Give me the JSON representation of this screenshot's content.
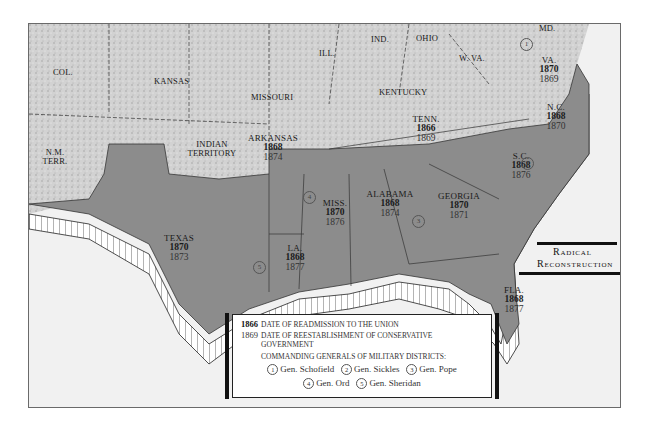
{
  "map": {
    "title_line1": "Radical",
    "title_line2": "Reconstruction",
    "colors": {
      "confederate_fill": "#8c8c8c",
      "union_fill": "#d4d4d4",
      "sea": "#f1f1f1",
      "border": "#333333"
    },
    "non_confederate_regions": [
      {
        "name": "COL."
      },
      {
        "name": "KANSAS"
      },
      {
        "name": "MISSOURI"
      },
      {
        "name": "ILL."
      },
      {
        "name": "IND."
      },
      {
        "name": "OHIO"
      },
      {
        "name": "W. VA."
      },
      {
        "name": "MD."
      },
      {
        "name": "KENTUCKY"
      },
      {
        "name": "INDIAN TERRITORY"
      },
      {
        "name": "N.M. TERR."
      }
    ],
    "states": [
      {
        "name": "VA.",
        "readmission": "1870",
        "conservative": "1869"
      },
      {
        "name": "N.C.",
        "readmission": "1868",
        "conservative": "1870"
      },
      {
        "name": "TENN.",
        "readmission": "1866",
        "conservative": "1869"
      },
      {
        "name": "S.C.",
        "readmission": "1868",
        "conservative": "1876"
      },
      {
        "name": "ARKANSAS",
        "readmission": "1868",
        "conservative": "1874"
      },
      {
        "name": "MISS.",
        "readmission": "1870",
        "conservative": "1876"
      },
      {
        "name": "ALABAMA",
        "readmission": "1868",
        "conservative": "1874"
      },
      {
        "name": "GEORGIA",
        "readmission": "1870",
        "conservative": "1871"
      },
      {
        "name": "TEXAS",
        "readmission": "1870",
        "conservative": "1873"
      },
      {
        "name": "LA.",
        "readmission": "1868",
        "conservative": "1877"
      },
      {
        "name": "FLA.",
        "readmission": "1868",
        "conservative": "1877"
      }
    ],
    "district_markers": [
      "1",
      "2",
      "3",
      "4",
      "5"
    ]
  },
  "legend": {
    "readmission_year": "1866",
    "readmission_text": "DATE OF READMISSION TO THE UNION",
    "conservative_year": "1869",
    "conservative_text": "DATE OF REESTABLISHMENT OF CONSERVATIVE",
    "conservative_text2": "GOVERNMENT",
    "generals_heading": "COMMANDING GENERALS OF MILITARY DISTRICTS:",
    "generals": [
      {
        "num": "1",
        "name": "Gen. Schofield"
      },
      {
        "num": "2",
        "name": "Gen. Sickles"
      },
      {
        "num": "3",
        "name": "Gen. Pope"
      },
      {
        "num": "4",
        "name": "Gen. Ord"
      },
      {
        "num": "5",
        "name": "Gen. Sheridan"
      }
    ]
  }
}
